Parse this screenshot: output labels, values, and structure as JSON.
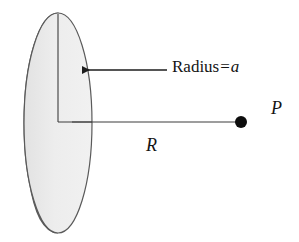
{
  "figure": {
    "type": "physics-diagram",
    "background_color": "#ffffff",
    "labels": {
      "radius_prefix": "Radius",
      "radius_equals": "=",
      "radius_symbol": "a",
      "distance_symbol": "R",
      "point_symbol": "P"
    },
    "colors": {
      "disk_face": "#ececec",
      "disk_edge_rim": "#c2c2c2",
      "outline": "#4a4a4a",
      "line": "#2b2b2b",
      "point_fill": "#0d0d0d",
      "text": "#141414"
    },
    "geometry": {
      "disk_face_center_x": 58,
      "disk_face_center_y": 123,
      "disk_face_radius_x": 34,
      "disk_face_radius_y": 110,
      "disk_rim_offset_x": -13,
      "disk_rim_offset_y": 4,
      "radius_line_top_y": 14,
      "axis_line_y": 122,
      "axis_line_start_x": 72,
      "point_p_x": 241,
      "point_p_y": 122,
      "point_p_dot_radius": 6,
      "arrow_tip_x": 73,
      "arrow_tail_x": 167,
      "arrow_y": 70
    }
  }
}
